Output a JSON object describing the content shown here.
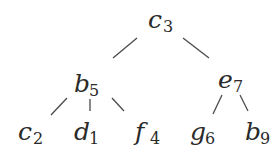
{
  "tree": {
    "nodes": [
      {
        "id": "c3",
        "letter": "c",
        "subscript": "3",
        "x": 148,
        "y": 28,
        "level": 0
      },
      {
        "id": "b5",
        "letter": "b",
        "subscript": "5",
        "x": 74,
        "y": 92,
        "level": 1
      },
      {
        "id": "e7",
        "letter": "e",
        "subscript": "7",
        "x": 218,
        "y": 88,
        "level": 1
      },
      {
        "id": "c2",
        "letter": "c",
        "subscript": "2",
        "x": 18,
        "y": 140,
        "level": 2
      },
      {
        "id": "d1",
        "letter": "d",
        "subscript": "1",
        "x": 74,
        "y": 140,
        "level": 2
      },
      {
        "id": "f4",
        "letter": "f",
        "subscript": "4",
        "x": 135,
        "y": 140,
        "level": 2
      },
      {
        "id": "g6",
        "letter": "g",
        "subscript": "6",
        "x": 190,
        "y": 140,
        "level": 2
      },
      {
        "id": "b9",
        "letter": "b",
        "subscript": "9",
        "x": 245,
        "y": 140,
        "level": 2
      }
    ],
    "edges": [
      {
        "from": "c3",
        "to": "b5",
        "x1": 137,
        "y1": 38,
        "x2": 113,
        "y2": 58
      },
      {
        "from": "c3",
        "to": "e7",
        "x1": 183,
        "y1": 38,
        "x2": 209,
        "y2": 58
      },
      {
        "from": "b5",
        "to": "c2",
        "x1": 67,
        "y1": 98,
        "x2": 51,
        "y2": 115
      },
      {
        "from": "b5",
        "to": "d1",
        "x1": 90,
        "y1": 99,
        "x2": 90,
        "y2": 111
      },
      {
        "from": "b5",
        "to": "f4",
        "x1": 112,
        "y1": 98,
        "x2": 124,
        "y2": 111
      },
      {
        "from": "e7",
        "to": "g6",
        "x1": 222,
        "y1": 95,
        "x2": 213,
        "y2": 114
      },
      {
        "from": "e7",
        "to": "b9",
        "x1": 240,
        "y1": 95,
        "x2": 248,
        "y2": 111
      }
    ]
  }
}
